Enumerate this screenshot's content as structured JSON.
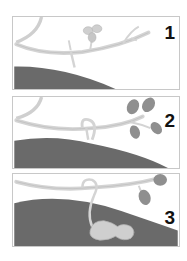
{
  "figure": {
    "panels": [
      {
        "label": "1",
        "stage": "flower-on-stem"
      },
      {
        "label": "2",
        "stage": "peg-forming"
      },
      {
        "label": "3",
        "stage": "peanut-pod-in-soil"
      }
    ]
  },
  "colors": {
    "soil": "#6a6a6a",
    "stem": "#d4d4d4",
    "stem_outline": "#b4b4b4",
    "leaf": "#8f8f8f",
    "pod": "#cfcfcf",
    "border": "#c8c8c8",
    "label": "#111111"
  }
}
